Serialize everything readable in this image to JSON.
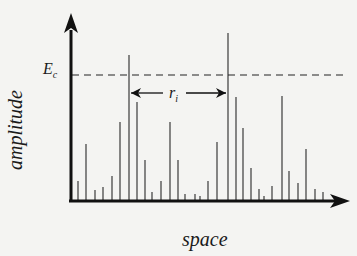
{
  "figure": {
    "x_axis_label": "space",
    "y_axis_label": "amplitude",
    "threshold_label": "E",
    "threshold_label_sub": "c",
    "interval_label": "r",
    "interval_label_sub": "i",
    "line_color": "#1a1a1a",
    "spike_color": "#555555",
    "background": "#f4f4f2"
  },
  "chart_data": {
    "type": "bar",
    "title": "",
    "xlabel": "space",
    "ylabel": "amplitude",
    "threshold": {
      "name": "E_c",
      "pixel_y": 75,
      "style": "dashed"
    },
    "interval_annotation": {
      "name": "r_i",
      "from_x": 129,
      "to_x": 228,
      "pixel_y": 93
    },
    "baseline_y": 201,
    "spikes": [
      {
        "x": 78,
        "top": 181
      },
      {
        "x": 86,
        "top": 144
      },
      {
        "x": 95,
        "top": 190
      },
      {
        "x": 103,
        "top": 187
      },
      {
        "x": 112,
        "top": 176
      },
      {
        "x": 120,
        "top": 122
      },
      {
        "x": 129,
        "top": 55
      },
      {
        "x": 137,
        "top": 102
      },
      {
        "x": 145,
        "top": 160
      },
      {
        "x": 152,
        "top": 192
      },
      {
        "x": 161,
        "top": 181
      },
      {
        "x": 170,
        "top": 122
      },
      {
        "x": 178,
        "top": 160
      },
      {
        "x": 185,
        "top": 194
      },
      {
        "x": 195,
        "top": 194
      },
      {
        "x": 200,
        "top": 196
      },
      {
        "x": 208,
        "top": 181
      },
      {
        "x": 217,
        "top": 142
      },
      {
        "x": 228,
        "top": 33
      },
      {
        "x": 236,
        "top": 97
      },
      {
        "x": 243,
        "top": 128
      },
      {
        "x": 251,
        "top": 168
      },
      {
        "x": 259,
        "top": 189
      },
      {
        "x": 264,
        "top": 196
      },
      {
        "x": 272,
        "top": 186
      },
      {
        "x": 282,
        "top": 96
      },
      {
        "x": 289,
        "top": 171
      },
      {
        "x": 298,
        "top": 183
      },
      {
        "x": 306,
        "top": 149
      },
      {
        "x": 315,
        "top": 189
      },
      {
        "x": 323,
        "top": 192
      }
    ],
    "grid": false,
    "legend": "none"
  }
}
